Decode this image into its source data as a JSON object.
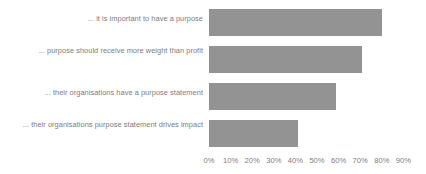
{
  "chart_data": {
    "type": "bar",
    "orientation": "horizontal",
    "title": "",
    "subtitle": "",
    "xlabel": "",
    "ylabel": "",
    "categories": [
      "... it is important to have a purpose",
      "... purpose should receive more weight than profit",
      "... their organisations have a purpose statement",
      "... their organisations purpose statement drives impact"
    ],
    "values": [
      80,
      71,
      59,
      41
    ],
    "value_suffix": "%",
    "xlim": [
      0,
      90
    ],
    "xticks": [
      0,
      10,
      20,
      30,
      40,
      50,
      60,
      70,
      80,
      90
    ],
    "xtick_labels": [
      "0%",
      "10%",
      "20%",
      "30%",
      "40%",
      "50%",
      "60%",
      "70%",
      "80%",
      "90%"
    ],
    "grid": false,
    "legend": null,
    "series": [
      {
        "name": "",
        "values": [
          80,
          71,
          59,
          41
        ],
        "color": "#939393"
      }
    ],
    "colors": {
      "bar": "#939393",
      "label_text": "#7c7c7c",
      "tick_text": "#7c7c7c",
      "background": "#ffffff"
    }
  },
  "layout": {
    "plot_left_px": 209,
    "px_per_ten_percent": 21.6,
    "bar_height_px": 27,
    "bar_tops_px": [
      9,
      46,
      83,
      120
    ],
    "axis_label_top_px": 156
  }
}
